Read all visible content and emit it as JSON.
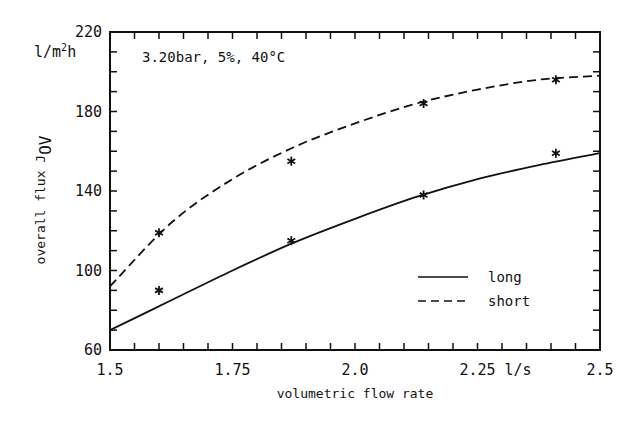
{
  "chart_data": {
    "type": "line",
    "title": "",
    "annotation": "3.20bar, 5%, 40°C",
    "xlabel": "volumetric flow rate",
    "xunit": "l/s",
    "ylabel": "overall flux J",
    "ylabel_subscript": "OV",
    "yunit": "l/m²h",
    "xlim": [
      1.5,
      2.5
    ],
    "ylim": [
      60,
      220
    ],
    "x_ticks": [
      {
        "value": 1.5,
        "label": "1.5"
      },
      {
        "value": 1.75,
        "label": "1.75"
      },
      {
        "value": 2.0,
        "label": "2.0"
      },
      {
        "value": 2.25,
        "label": "2.25"
      },
      {
        "value": 2.5,
        "label": "2.5"
      }
    ],
    "y_ticks": [
      {
        "value": 60,
        "label": "60"
      },
      {
        "value": 100,
        "label": "100"
      },
      {
        "value": 140,
        "label": "140"
      },
      {
        "value": 180,
        "label": "180"
      },
      {
        "value": 220,
        "label": "220"
      }
    ],
    "x_minor_step": 0.05,
    "y_minor_step": 10,
    "grid": false,
    "legend_position": "lower right",
    "series": [
      {
        "name": "long",
        "line_style": "solid",
        "marker": "asterisk",
        "points": [
          {
            "x": 1.6,
            "y": 90
          },
          {
            "x": 1.87,
            "y": 115
          },
          {
            "x": 2.14,
            "y": 138
          },
          {
            "x": 2.41,
            "y": 159
          }
        ],
        "fit_curve": [
          {
            "x": 1.5,
            "y": 70
          },
          {
            "x": 1.625,
            "y": 85
          },
          {
            "x": 1.75,
            "y": 100
          },
          {
            "x": 1.875,
            "y": 114
          },
          {
            "x": 2.0,
            "y": 126
          },
          {
            "x": 2.125,
            "y": 137
          },
          {
            "x": 2.25,
            "y": 146
          },
          {
            "x": 2.375,
            "y": 153
          },
          {
            "x": 2.5,
            "y": 159
          }
        ]
      },
      {
        "name": "short",
        "line_style": "dashed",
        "marker": "asterisk",
        "points": [
          {
            "x": 1.6,
            "y": 119
          },
          {
            "x": 1.87,
            "y": 155
          },
          {
            "x": 2.14,
            "y": 184
          },
          {
            "x": 2.41,
            "y": 196
          }
        ],
        "fit_curve": [
          {
            "x": 1.5,
            "y": 92
          },
          {
            "x": 1.625,
            "y": 124
          },
          {
            "x": 1.75,
            "y": 146
          },
          {
            "x": 1.875,
            "y": 162
          },
          {
            "x": 2.0,
            "y": 174
          },
          {
            "x": 2.125,
            "y": 184
          },
          {
            "x": 2.25,
            "y": 191
          },
          {
            "x": 2.375,
            "y": 196
          },
          {
            "x": 2.5,
            "y": 198
          }
        ]
      }
    ]
  },
  "legend": {
    "items": [
      {
        "label": "long",
        "style": "solid"
      },
      {
        "label": "short",
        "style": "dashed"
      }
    ]
  },
  "colors": {
    "ink": "#111111",
    "background": "#ffffff"
  }
}
